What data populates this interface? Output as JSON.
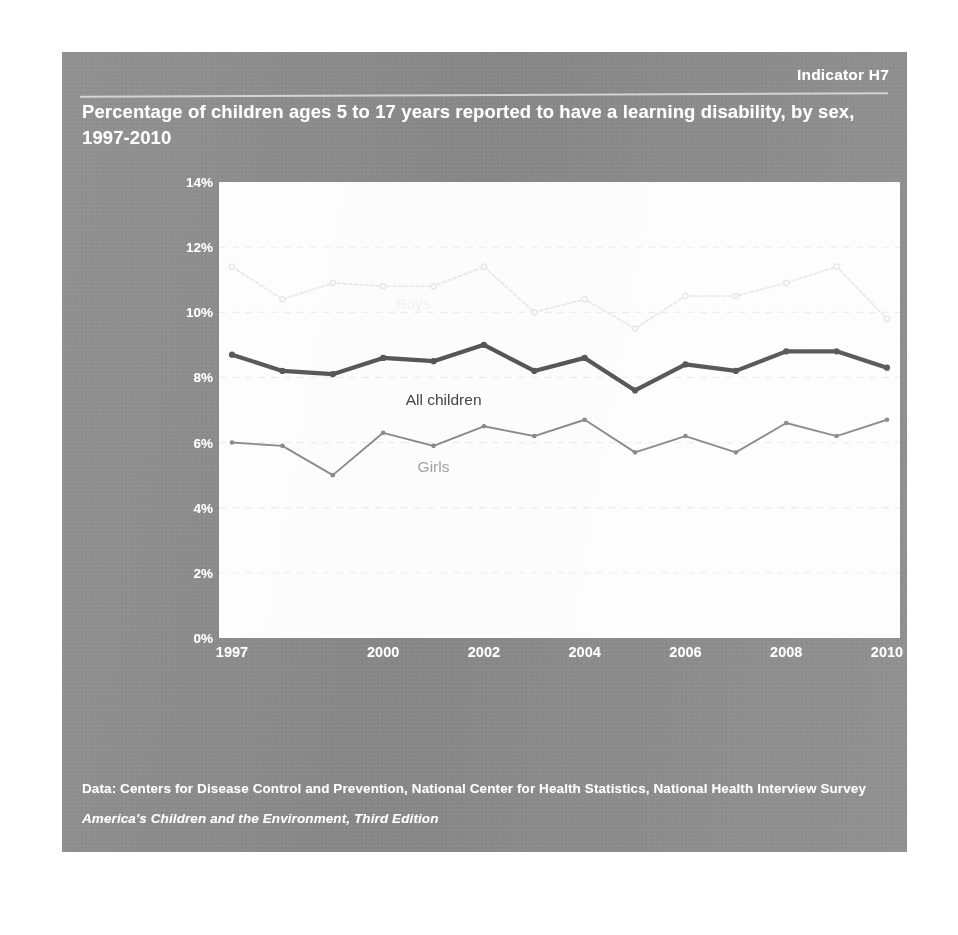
{
  "indicator": "Indicator H7",
  "title": "Percentage of children ages 5 to 17 years reported to have a learning disability, by sex, 1997-2010",
  "footer": {
    "source": "Data: Centers for Disease Control and Prevention, National Center for Health Statistics, National Health Interview Survey",
    "report": "America's Children and the Environment, Third Edition"
  },
  "colors": {
    "panel": "#8b8b8b",
    "plot_background": "#fdfdfd",
    "boys_line": "#e8e8e8",
    "all_children_line": "#595959",
    "girls_line": "#8c8c8c",
    "axis_text": "#ffffff",
    "gridline": "#ededed"
  },
  "chart_data": {
    "type": "line",
    "title": "Percentage of children ages 5 to 17 years reported to have a learning disability, by sex, 1997-2010",
    "xlabel": "",
    "ylabel": "",
    "ylim": [
      0,
      14
    ],
    "yticks": [
      "0%",
      "2%",
      "4%",
      "6%",
      "8%",
      "10%",
      "12%",
      "14%"
    ],
    "ytick_values": [
      0,
      2,
      4,
      6,
      8,
      10,
      12,
      14
    ],
    "x": [
      1997,
      1998,
      1999,
      2000,
      2001,
      2002,
      2003,
      2004,
      2005,
      2006,
      2007,
      2008,
      2009,
      2010
    ],
    "xtick_labels": [
      "1997",
      "2000",
      "2002",
      "2004",
      "2006",
      "2008",
      "2010"
    ],
    "xtick_values": [
      1997,
      2000,
      2002,
      2004,
      2006,
      2008,
      2010
    ],
    "grid": true,
    "grid_axis": "y",
    "legend": "inline-annotations",
    "series": [
      {
        "name": "Boys",
        "color": "#e8e8e8",
        "style": "dotted",
        "values": [
          11.4,
          10.4,
          10.9,
          10.8,
          10.8,
          11.4,
          10.0,
          10.4,
          9.5,
          10.5,
          10.5,
          10.9,
          11.4,
          9.8
        ]
      },
      {
        "name": "All children",
        "color": "#595959",
        "style": "solid-thick",
        "values": [
          8.7,
          8.2,
          8.1,
          8.6,
          8.5,
          9.0,
          8.2,
          8.6,
          7.6,
          8.4,
          8.2,
          8.8,
          8.8,
          8.3
        ]
      },
      {
        "name": "Girls",
        "color": "#8c8c8c",
        "style": "solid-thin",
        "values": [
          6.0,
          5.9,
          5.0,
          6.3,
          5.9,
          6.5,
          6.2,
          6.7,
          5.7,
          6.2,
          5.7,
          6.6,
          6.2,
          6.7
        ]
      }
    ],
    "annotations": [
      {
        "text": "Boys",
        "x": 2000.6,
        "y": 10.25
      },
      {
        "text": "All children",
        "x": 2001.2,
        "y": 7.3
      },
      {
        "text": "Girls",
        "x": 2001.0,
        "y": 5.25
      }
    ]
  }
}
